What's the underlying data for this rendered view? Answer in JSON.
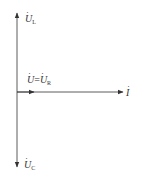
{
  "diagram": {
    "type": "phasor-diagram",
    "colors": {
      "line": "#333333",
      "text": "#333333",
      "background": "#ffffff"
    },
    "phasors": [
      {
        "id": "UL",
        "symbol": "U",
        "subscript": "L",
        "direction": "up"
      },
      {
        "id": "UC",
        "symbol": "U",
        "subscript": "C",
        "direction": "down"
      },
      {
        "id": "U_UR",
        "symbol": "U",
        "label_eq": "=",
        "symbol2": "U",
        "subscript2": "R",
        "direction": "right",
        "relative_length": "short"
      },
      {
        "id": "I",
        "symbol": "I",
        "direction": "right",
        "relative_length": "long"
      }
    ],
    "labels": {
      "ul_symbol": "U",
      "ul_sub": "L",
      "uc_symbol": "U",
      "uc_sub": "C",
      "u_symbol": "U",
      "eq": "=",
      "ur_symbol": "U",
      "ur_sub": "R",
      "i_symbol": "I"
    }
  }
}
